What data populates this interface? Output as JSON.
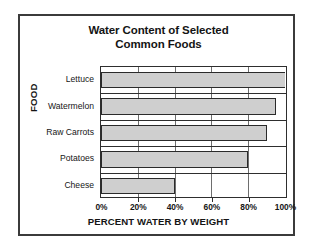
{
  "chart_data": {
    "type": "bar",
    "orientation": "horizontal",
    "title": "Water Content of Selected Common Foods",
    "title_lines": [
      "Water Content of Selected",
      "Common Foods"
    ],
    "xlabel": "PERCENT WATER BY WEIGHT",
    "ylabel": "FOOD",
    "categories": [
      "Lettuce",
      "Watermelon",
      "Raw Carrots",
      "Potatoes",
      "Cheese"
    ],
    "values": [
      100,
      95,
      90,
      80,
      40
    ],
    "xlim": [
      0,
      100
    ],
    "xticks": [
      0,
      20,
      40,
      60,
      80,
      100
    ],
    "xtick_labels": [
      "0%",
      "20%",
      "40%",
      "60%",
      "80%",
      "100%"
    ],
    "grid": true,
    "legend": null,
    "bar_color": "#cfcfcf",
    "bar_border_color": "#2b2b2b",
    "frame_color": "#3b3b3b"
  }
}
